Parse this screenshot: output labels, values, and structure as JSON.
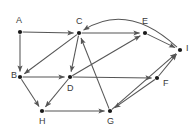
{
  "figure": {
    "type": "directed-graph",
    "background_color": "#ffffff",
    "node_color": "#1a1a1a",
    "edge_color": "#555555",
    "label_color": "#3a3a3a",
    "width": 192,
    "height": 130
  },
  "nodes": [
    {
      "id": "A",
      "label": "A",
      "x": 20,
      "y": 32,
      "label_x": 16,
      "label_y": 21
    },
    {
      "id": "C",
      "label": "C",
      "x": 79,
      "y": 33,
      "label_x": 76,
      "label_y": 22
    },
    {
      "id": "E",
      "label": "E",
      "x": 145,
      "y": 33,
      "label_x": 142,
      "label_y": 22
    },
    {
      "id": "I",
      "label": "I",
      "x": 180,
      "y": 50,
      "label_x": 186,
      "label_y": 49
    },
    {
      "id": "B",
      "label": "B",
      "x": 20,
      "y": 77,
      "label_x": 11,
      "label_y": 76
    },
    {
      "id": "D",
      "label": "D",
      "x": 70,
      "y": 77,
      "label_x": 67,
      "label_y": 89
    },
    {
      "id": "F",
      "label": "F",
      "x": 157,
      "y": 78,
      "label_x": 163,
      "label_y": 84
    },
    {
      "id": "H",
      "label": "H",
      "x": 42,
      "y": 111,
      "label_x": 39,
      "label_y": 122
    },
    {
      "id": "G",
      "label": "G",
      "x": 110,
      "y": 111,
      "label_x": 107,
      "label_y": 122
    }
  ],
  "edges": [
    {
      "from": "A",
      "to": "C",
      "shape": "straight"
    },
    {
      "from": "A",
      "to": "B",
      "shape": "straight"
    },
    {
      "from": "C",
      "to": "B",
      "shape": "straight"
    },
    {
      "from": "C",
      "to": "D",
      "shape": "straight"
    },
    {
      "from": "C",
      "to": "E",
      "shape": "straight"
    },
    {
      "from": "B",
      "to": "D",
      "shape": "straight"
    },
    {
      "from": "B",
      "to": "H",
      "shape": "straight"
    },
    {
      "from": "D",
      "to": "H",
      "shape": "straight"
    },
    {
      "from": "D",
      "to": "E",
      "shape": "straight"
    },
    {
      "from": "D",
      "to": "F",
      "shape": "straight"
    },
    {
      "from": "E",
      "to": "I",
      "shape": "straight"
    },
    {
      "from": "F",
      "to": "I",
      "shape": "straight"
    },
    {
      "from": "F",
      "to": "G",
      "shape": "straight"
    },
    {
      "from": "G",
      "to": "I",
      "shape": "straight"
    },
    {
      "from": "G",
      "to": "C",
      "shape": "straight"
    },
    {
      "from": "H",
      "to": "G",
      "shape": "straight"
    },
    {
      "from": "I",
      "to": "C",
      "shape": "curved",
      "curve_control_x": 128,
      "curve_control_y": 2
    }
  ]
}
